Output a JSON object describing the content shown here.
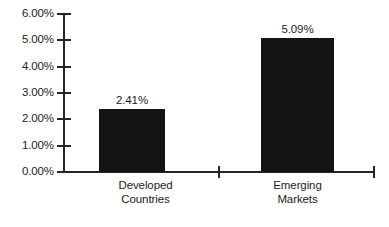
{
  "chart_data": {
    "type": "bar",
    "title": "",
    "subtitle": "",
    "xlabel": "",
    "ylabel": "",
    "categories": [
      "Developed Countries",
      "Emerging Markets"
    ],
    "category_lines": [
      [
        "Developed",
        "Countries"
      ],
      [
        "Emerging",
        "Markets"
      ]
    ],
    "values": [
      2.41,
      5.09
    ],
    "data_labels": [
      "2.41%",
      "5.09%"
    ],
    "ylim": [
      0,
      6
    ],
    "ytick_values": [
      0,
      1,
      2,
      3,
      4,
      5,
      6
    ],
    "ytick_labels": [
      "0.00%",
      "1.00%",
      "2.00%",
      "3.00%",
      "4.00%",
      "5.00%",
      "6.00%"
    ],
    "grid": false,
    "legend": false,
    "legend_position": "none",
    "bar_color": "#141414",
    "axis_color": "#262626",
    "background_color": "#ffffff",
    "text_color": "#1c1c1c"
  },
  "caption": {
    "cropped_text": ""
  }
}
